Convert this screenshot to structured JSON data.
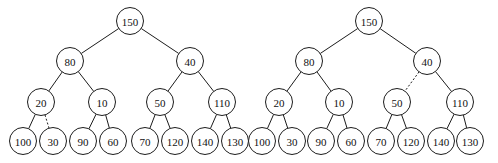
{
  "figure": {
    "background_color": "#ffffff",
    "stroke_color": "#1c1c1c",
    "node_fill_color": "#ffffff",
    "text_color": "#111111",
    "width": 498,
    "height": 163
  },
  "chart_data": {
    "type": "diagram",
    "subtype": "binary-tree-pair",
    "title": "",
    "node_radius": 13.5,
    "level_y": [
      21,
      61,
      102,
      141
    ],
    "trees": [
      {
        "name": "left-tree",
        "caption": "",
        "nodes": [
          {
            "id": "L-150",
            "label": "150",
            "x": 130,
            "y": 21,
            "level": 0
          },
          {
            "id": "L-80",
            "label": "80",
            "x": 70,
            "y": 61,
            "level": 1
          },
          {
            "id": "L-40",
            "label": "40",
            "x": 190,
            "y": 61,
            "level": 1
          },
          {
            "id": "L-20",
            "label": "20",
            "x": 41,
            "y": 102,
            "level": 2
          },
          {
            "id": "L-10",
            "label": "10",
            "x": 102,
            "y": 102,
            "level": 2
          },
          {
            "id": "L-50",
            "label": "50",
            "x": 160,
            "y": 102,
            "level": 2
          },
          {
            "id": "L-110",
            "label": "110",
            "x": 222,
            "y": 102,
            "level": 2
          },
          {
            "id": "L-100",
            "label": "100",
            "x": 23,
            "y": 141,
            "level": 3
          },
          {
            "id": "L-30",
            "label": "30",
            "x": 53,
            "y": 141,
            "level": 3
          },
          {
            "id": "L-90",
            "label": "90",
            "x": 83,
            "y": 141,
            "level": 3
          },
          {
            "id": "L-60",
            "label": "60",
            "x": 113,
            "y": 141,
            "level": 3
          },
          {
            "id": "L-70",
            "label": "70",
            "x": 145,
            "y": 141,
            "level": 3
          },
          {
            "id": "L-120",
            "label": "120",
            "x": 175,
            "y": 141,
            "level": 3
          },
          {
            "id": "L-140",
            "label": "140",
            "x": 205,
            "y": 141,
            "level": 3
          },
          {
            "id": "L-130",
            "label": "130",
            "x": 235,
            "y": 141,
            "level": 3
          }
        ],
        "edges": [
          {
            "from": "L-150",
            "to": "L-80",
            "style": "solid"
          },
          {
            "from": "L-150",
            "to": "L-40",
            "style": "solid"
          },
          {
            "from": "L-80",
            "to": "L-20",
            "style": "solid"
          },
          {
            "from": "L-80",
            "to": "L-10",
            "style": "solid"
          },
          {
            "from": "L-40",
            "to": "L-50",
            "style": "solid"
          },
          {
            "from": "L-40",
            "to": "L-110",
            "style": "solid"
          },
          {
            "from": "L-20",
            "to": "L-100",
            "style": "solid"
          },
          {
            "from": "L-20",
            "to": "L-30",
            "style": "dashed"
          },
          {
            "from": "L-10",
            "to": "L-90",
            "style": "solid"
          },
          {
            "from": "L-10",
            "to": "L-60",
            "style": "solid"
          },
          {
            "from": "L-50",
            "to": "L-70",
            "style": "solid"
          },
          {
            "from": "L-50",
            "to": "L-120",
            "style": "solid"
          },
          {
            "from": "L-110",
            "to": "L-140",
            "style": "solid"
          },
          {
            "from": "L-110",
            "to": "L-130",
            "style": "solid"
          }
        ]
      },
      {
        "name": "right-tree",
        "caption": "",
        "nodes": [
          {
            "id": "R-150",
            "label": "150",
            "x": 369,
            "y": 21,
            "level": 0
          },
          {
            "id": "R-80",
            "label": "80",
            "x": 309,
            "y": 61,
            "level": 1
          },
          {
            "id": "R-40",
            "label": "40",
            "x": 427,
            "y": 61,
            "level": 1
          },
          {
            "id": "R-20",
            "label": "20",
            "x": 279,
            "y": 102,
            "level": 2
          },
          {
            "id": "R-10",
            "label": "10",
            "x": 339,
            "y": 102,
            "level": 2
          },
          {
            "id": "R-50",
            "label": "50",
            "x": 397,
            "y": 102,
            "level": 2
          },
          {
            "id": "R-110",
            "label": "110",
            "x": 460,
            "y": 102,
            "level": 2
          },
          {
            "id": "R-100",
            "label": "100",
            "x": 262,
            "y": 141,
            "level": 3
          },
          {
            "id": "R-30",
            "label": "30",
            "x": 292,
            "y": 141,
            "level": 3
          },
          {
            "id": "R-90",
            "label": "90",
            "x": 321,
            "y": 141,
            "level": 3
          },
          {
            "id": "R-60",
            "label": "60",
            "x": 351,
            "y": 141,
            "level": 3
          },
          {
            "id": "R-70",
            "label": "70",
            "x": 381,
            "y": 141,
            "level": 3
          },
          {
            "id": "R-120",
            "label": "120",
            "x": 411,
            "y": 141,
            "level": 3
          },
          {
            "id": "R-140",
            "label": "140",
            "x": 441,
            "y": 141,
            "level": 3
          },
          {
            "id": "R-130",
            "label": "130",
            "x": 470,
            "y": 141,
            "level": 3
          }
        ],
        "edges": [
          {
            "from": "R-150",
            "to": "R-80",
            "style": "solid"
          },
          {
            "from": "R-150",
            "to": "R-40",
            "style": "solid"
          },
          {
            "from": "R-80",
            "to": "R-20",
            "style": "solid"
          },
          {
            "from": "R-80",
            "to": "R-10",
            "style": "solid"
          },
          {
            "from": "R-40",
            "to": "R-50",
            "style": "dashed"
          },
          {
            "from": "R-40",
            "to": "R-110",
            "style": "solid"
          },
          {
            "from": "R-20",
            "to": "R-100",
            "style": "solid"
          },
          {
            "from": "R-20",
            "to": "R-30",
            "style": "solid"
          },
          {
            "from": "R-10",
            "to": "R-90",
            "style": "solid"
          },
          {
            "from": "R-10",
            "to": "R-60",
            "style": "solid"
          },
          {
            "from": "R-50",
            "to": "R-70",
            "style": "solid"
          },
          {
            "from": "R-50",
            "to": "R-120",
            "style": "solid"
          },
          {
            "from": "R-110",
            "to": "R-140",
            "style": "solid"
          },
          {
            "from": "R-110",
            "to": "R-130",
            "style": "solid"
          }
        ]
      }
    ]
  }
}
